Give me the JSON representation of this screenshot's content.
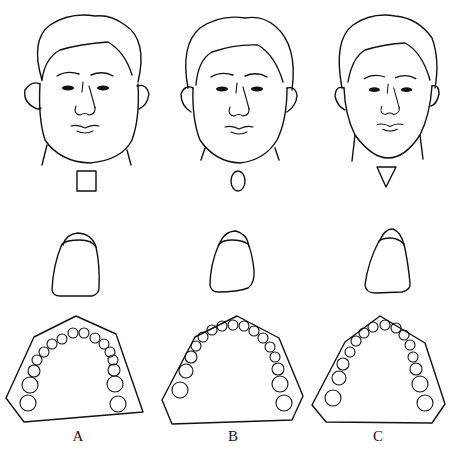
{
  "figure": {
    "columns": [
      {
        "label": "A",
        "face_shape": "square",
        "symbol": "square-symbol",
        "tooth_shape": "square",
        "arch_shape": "square"
      },
      {
        "label": "B",
        "face_shape": "ovoid",
        "symbol": "oval-symbol",
        "tooth_shape": "ovoid",
        "arch_shape": "ovoid"
      },
      {
        "label": "C",
        "face_shape": "tapering",
        "symbol": "triangle-symbol",
        "tooth_shape": "tapering",
        "arch_shape": "tapering"
      }
    ],
    "rows": [
      "face-outline",
      "incisor-crown",
      "dental-arch"
    ]
  }
}
